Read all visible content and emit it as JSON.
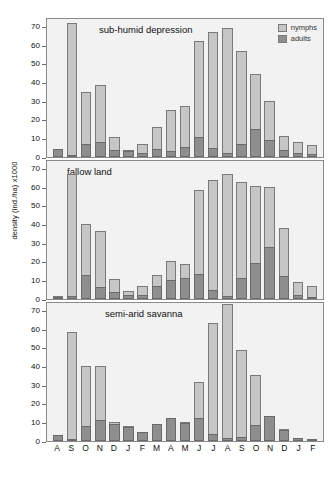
{
  "chart_data": {
    "type": "bar",
    "title": "",
    "xlabel": "",
    "ylabel": "density (ind./ha) x1000",
    "ylim": [
      0,
      75
    ],
    "yticks": [
      0,
      10,
      20,
      30,
      40,
      50,
      60,
      70
    ],
    "grid": false,
    "stacked": true,
    "legend_position": "top-right",
    "legend": [
      "nymphs",
      "adults"
    ],
    "categories": [
      "A",
      "S",
      "O",
      "N",
      "D",
      "J",
      "F",
      "M",
      "A",
      "M",
      "J",
      "J",
      "A",
      "S",
      "O",
      "N",
      "D",
      "J",
      "F"
    ],
    "panels": [
      {
        "title": "sub-humid depression",
        "series": [
          {
            "name": "adults",
            "values": [
              4.3,
              1.2,
              6.8,
              7.8,
              4.0,
              3.0,
              2.0,
              4.5,
              3.3,
              5.5,
              10.8,
              4.8,
              2.0,
              7.2,
              14.8,
              9.0,
              3.5,
              2.0,
              1.5
            ]
          },
          {
            "name": "nymphs",
            "values": [
              0.0,
              70.8,
              27.8,
              30.9,
              6.6,
              0.3,
              5.0,
              11.8,
              21.8,
              21.9,
              51.1,
              62.4,
              66.9,
              49.4,
              29.9,
              20.9,
              7.8,
              6.3,
              5.0
            ]
          }
        ],
        "totals": [
          4.3,
          72.0,
          34.6,
          38.7,
          10.6,
          3.3,
          7.0,
          16.3,
          25.1,
          27.4,
          61.9,
          67.2,
          68.9,
          56.6,
          44.7,
          29.9,
          11.3,
          8.3,
          6.5
        ]
      },
      {
        "title": "fallow land",
        "series": [
          {
            "name": "adults",
            "values": [
              0.6,
              1.8,
              12.9,
              6.3,
              3.8,
              2.3,
              2.0,
              7.0,
              10.1,
              11.0,
              13.3,
              5.0,
              1.5,
              11.3,
              19.3,
              28.0,
              12.5,
              2.0,
              1.3
            ]
          },
          {
            "name": "nymphs",
            "values": [
              0.2,
              65.3,
              27.3,
              30.2,
              6.8,
              2.1,
              5.2,
              6.0,
              10.5,
              7.9,
              45.0,
              58.9,
              65.5,
              51.5,
              41.0,
              31.9,
              25.5,
              7.0,
              5.5
            ]
          }
        ],
        "totals": [
          0.8,
          67.1,
          40.2,
          36.5,
          10.6,
          4.4,
          7.2,
          13.0,
          20.6,
          18.9,
          58.3,
          63.9,
          67.0,
          62.8,
          60.3,
          59.9,
          38.0,
          9.0,
          6.8
        ]
      },
      {
        "title": "semi-arid savanna",
        "series": [
          {
            "name": "adults",
            "values": [
              3.4,
              1.3,
              8.2,
              11.1,
              9.3,
              7.3,
              4.9,
              9.0,
              12.2,
              9.4,
              12.1,
              4.0,
              1.8,
              2.0,
              8.5,
              13.6,
              5.8,
              1.6,
              1.0
            ]
          },
          {
            "name": "nymphs",
            "values": [
              0.0,
              57.2,
              32.2,
              28.9,
              1.1,
              0.4,
              0.0,
              0.0,
              0.0,
              0.4,
              19.6,
              59.4,
              71.8,
              47.0,
              26.7,
              0.0,
              0.3,
              0.0,
              0.0
            ]
          }
        ],
        "totals": [
          3.4,
          58.5,
          40.4,
          40.0,
          10.4,
          7.7,
          4.9,
          9.0,
          12.2,
          9.8,
          31.7,
          63.4,
          73.6,
          49.0,
          35.2,
          13.6,
          6.1,
          1.6,
          1.0
        ]
      }
    ],
    "colors": {
      "nymphs": "#c6c6c6",
      "adults": "#8e8e8e",
      "panel_background": "#f2f2f2",
      "axis": "#8a8a8a",
      "text": "#111111"
    }
  }
}
